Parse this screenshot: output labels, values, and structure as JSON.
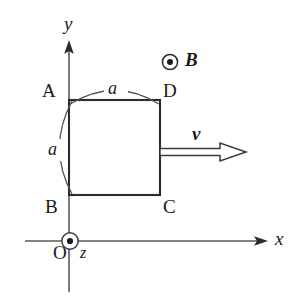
{
  "figure": {
    "type": "physics-diagram",
    "background_color": "#ffffff",
    "ink_color": "#1a1a1a",
    "axis_color": "#555555"
  },
  "axes": {
    "x_label": "x",
    "y_label": "y",
    "z_label": "z",
    "origin_label": "O",
    "origin_marker": "circle-dot-out-of-page",
    "x_axis": {
      "start_x": 25,
      "end_x": 268,
      "y": 241
    },
    "y_axis": {
      "x": 69,
      "top_y": 42,
      "bottom_y": 292
    }
  },
  "loop": {
    "name": "square-loop",
    "vertices": [
      {
        "label": "A",
        "corner": "top-left",
        "x": 69,
        "y": 100
      },
      {
        "label": "D",
        "corner": "top-right",
        "x": 160,
        "y": 100
      },
      {
        "label": "C",
        "corner": "bottom-right",
        "x": 160,
        "y": 195
      },
      {
        "label": "B",
        "corner": "bottom-left",
        "x": 69,
        "y": 195
      }
    ],
    "side_length_label": "a",
    "dimension_labels": [
      {
        "label": "a",
        "side": "top",
        "arc": "above"
      },
      {
        "label": "a",
        "side": "left",
        "arc": "left"
      }
    ]
  },
  "field": {
    "symbol_label": "B",
    "marker": "circle-dot-out-of-page",
    "direction": "out-of-page",
    "marker_center": {
      "x": 170,
      "y": 62
    },
    "label_position": {
      "x": 185,
      "y": 50
    }
  },
  "velocity": {
    "symbol_label": "v",
    "direction": "right",
    "arrow_style": "hollow-outline",
    "arrow_start_x": 160,
    "arrow_end_x": 246,
    "arrow_y": 152,
    "label_position": {
      "x": 192,
      "y": 125
    }
  }
}
